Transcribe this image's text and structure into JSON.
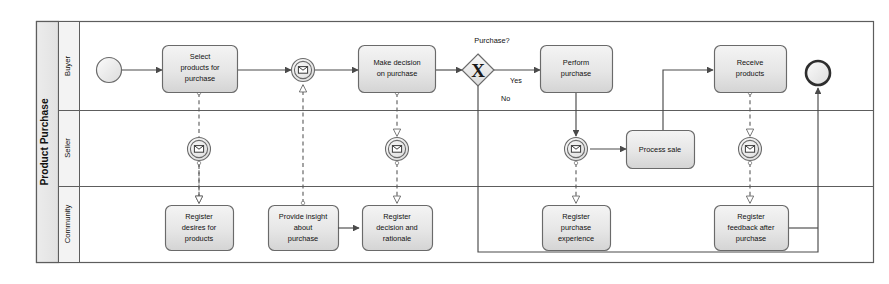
{
  "diagram": {
    "type": "bpmn-collaboration",
    "pool": {
      "name": "Product Purchase"
    },
    "lanes": [
      {
        "id": "buyer",
        "name": "Buyer"
      },
      {
        "id": "seller",
        "name": "Seller"
      },
      {
        "id": "community",
        "name": "Community"
      }
    ],
    "events": {
      "start": {
        "name": "start-event",
        "lane": "buyer"
      },
      "end": {
        "name": "end-event",
        "lane": "buyer"
      },
      "msg_buyer_offer": {
        "name": "intermediate-message-event",
        "lane": "buyer",
        "icon": "envelope-icon"
      },
      "msg_seller_1": {
        "name": "intermediate-message-event",
        "lane": "seller",
        "icon": "envelope-icon"
      },
      "msg_seller_2": {
        "name": "intermediate-message-event",
        "lane": "seller",
        "icon": "envelope-icon"
      },
      "msg_seller_3": {
        "name": "intermediate-message-event",
        "lane": "seller",
        "icon": "envelope-icon"
      },
      "msg_seller_4": {
        "name": "intermediate-message-event",
        "lane": "seller",
        "icon": "envelope-icon"
      }
    },
    "gateway": {
      "name": "exclusive-gateway",
      "label": "Purchase?",
      "symbol": "X",
      "outgoing": [
        {
          "label": "Yes"
        },
        {
          "label": "No"
        }
      ]
    },
    "tasks": [
      {
        "id": "t_select",
        "lane": "buyer",
        "lines": [
          "Select",
          "products for",
          "purchase"
        ]
      },
      {
        "id": "t_decide",
        "lane": "buyer",
        "lines": [
          "Make decision",
          "on purchase"
        ]
      },
      {
        "id": "t_perform",
        "lane": "buyer",
        "lines": [
          "Perform",
          "purchase"
        ]
      },
      {
        "id": "t_receive",
        "lane": "buyer",
        "lines": [
          "Receive",
          "products"
        ]
      },
      {
        "id": "t_process",
        "lane": "seller",
        "lines": [
          "Process sale"
        ]
      },
      {
        "id": "t_desires",
        "lane": "community",
        "lines": [
          "Register",
          "desires for",
          "products"
        ]
      },
      {
        "id": "t_insight",
        "lane": "community",
        "lines": [
          "Provide insight",
          "about",
          "purchase"
        ]
      },
      {
        "id": "t_rational",
        "lane": "community",
        "lines": [
          "Register",
          "decision and",
          "rationale"
        ]
      },
      {
        "id": "t_exp",
        "lane": "community",
        "lines": [
          "Register",
          "purchase",
          "experience"
        ]
      },
      {
        "id": "t_feedback",
        "lane": "community",
        "lines": [
          "Register",
          "feedback after",
          "purchase"
        ]
      }
    ],
    "colors": {
      "stroke": "#6f6f6f",
      "dark_stroke": "#3c3c3c",
      "task_fill_top": "#f2f2f2",
      "task_fill_bottom": "#d8d8d8",
      "lane_header_fill": "#ededed",
      "pool_header_fill": "#e8e8e8",
      "canvas": "#ffffff"
    }
  }
}
